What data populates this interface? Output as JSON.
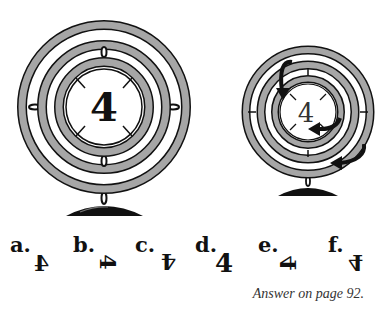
{
  "puzzle": {
    "left_gyroscope": {
      "center_digit": "4"
    },
    "right_gyroscope": {
      "center_digit": "4",
      "arrows": [
        "outer-ring-clockwise",
        "middle-ring-left",
        "inner-ring-down"
      ]
    },
    "options": [
      {
        "label": "a.",
        "glyph": "4",
        "transform": "rotate(0deg) scaleX(-1)"
      },
      {
        "label": "b.",
        "glyph": "4",
        "transform": "rotate(90deg)"
      },
      {
        "label": "c.",
        "glyph": "4",
        "transform": "rotate(180deg)"
      },
      {
        "label": "d.",
        "glyph": "4",
        "transform": "none"
      },
      {
        "label": "e.",
        "glyph": "4",
        "transform": "rotate(-90deg) scaleX(-1)"
      },
      {
        "label": "f.",
        "glyph": "4",
        "transform": "rotate(180deg) scaleX(-1)"
      }
    ],
    "answer_note": "Answer on page 92."
  },
  "colors": {
    "ring_fill": "#a6a6a6",
    "ring_stroke": "#1a1a1a",
    "ink": "#111111"
  }
}
